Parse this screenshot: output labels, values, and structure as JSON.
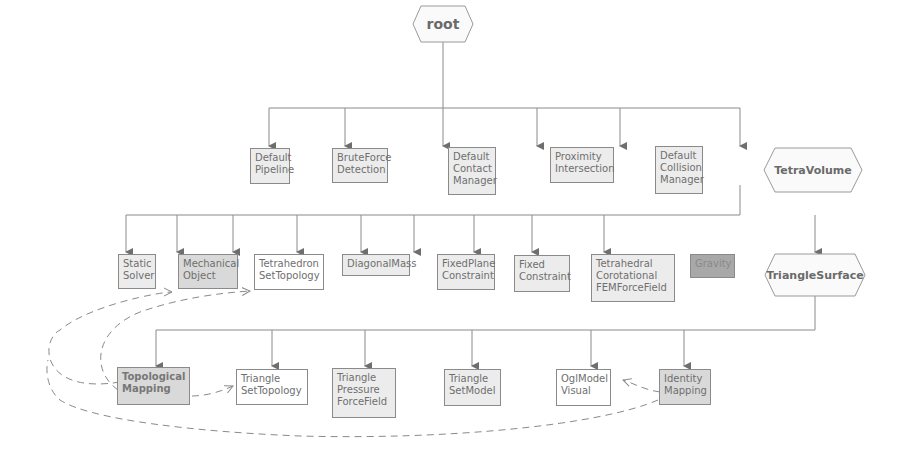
{
  "diagram": {
    "colors": {
      "line": "#8a8a8a",
      "arrow": "#6e6e6e",
      "node_light": "#ececec",
      "node_white": "#ffffff",
      "node_mid": "#d9d9d9",
      "node_dark": "#a8a8a8"
    },
    "root": {
      "label": "root"
    },
    "level1": [
      {
        "label": "Default\nPipeline"
      },
      {
        "label": "BruteForce\nDetection"
      },
      {
        "label": "Default\nContact\nManager"
      },
      {
        "label": "Proximity\nIntersection"
      },
      {
        "label": "Default\nCollision\nManager"
      }
    ],
    "tetra_volume": {
      "label": "TetraVolume"
    },
    "level2": [
      {
        "label": "Static\nSolver"
      },
      {
        "label": "Mechanical\nObject"
      },
      {
        "label": "Tetrahedron\nSetTopology"
      },
      {
        "label": "DiagonalMass"
      },
      {
        "label": "FixedPlane\nConstraint"
      },
      {
        "label": "Fixed\nConstraint"
      },
      {
        "label": "Tetrahedral\nCorotational\nFEMForceField"
      },
      {
        "label": "Gravity"
      }
    ],
    "triangle_surface": {
      "label": "TriangleSurface"
    },
    "level3": [
      {
        "label": "Topological\nMapping"
      },
      {
        "label": "Triangle\nSetTopology"
      },
      {
        "label": "Triangle\nPressure\nForceField"
      },
      {
        "label": "Triangle\nSetModel"
      },
      {
        "label": "OglModel\nVisual"
      },
      {
        "label": "Identity\nMapping"
      }
    ],
    "dashed_links": [
      {
        "from": "Topological Mapping",
        "to": "Mechanical Object"
      },
      {
        "from": "Topological Mapping",
        "to": "Tetrahedron SetTopology"
      },
      {
        "from": "Topological Mapping",
        "to": "Triangle SetTopology"
      },
      {
        "from": "Identity Mapping",
        "to": "OglModel Visual"
      },
      {
        "from": "Identity Mapping",
        "to": "Mechanical Object"
      }
    ]
  }
}
